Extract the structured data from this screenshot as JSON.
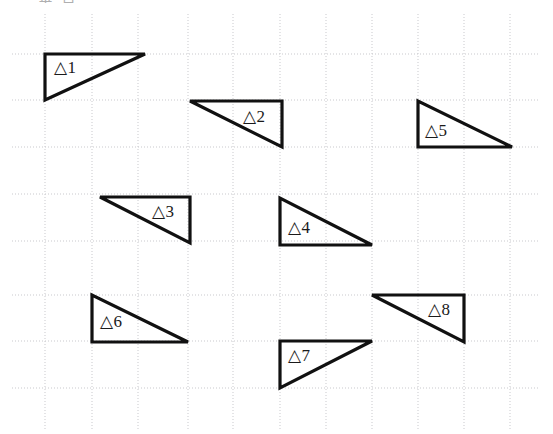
{
  "page": {
    "background_color": "#ffffff",
    "width": 553,
    "height": 434,
    "cut_off_header_text": "垂 直"
  },
  "grid": {
    "name": "dotted-grid",
    "line_color": "#c9c9cd",
    "line_style": "dotted",
    "line_width": 1,
    "dash_pattern": "1,2",
    "spacing_px": 46,
    "vertical_lines_x": [
      45,
      92,
      138,
      188,
      233,
      280,
      326,
      372,
      418,
      464,
      510
    ],
    "horizontal_lines_y": [
      54,
      100,
      147,
      194,
      241,
      295,
      341,
      388
    ]
  },
  "figures": {
    "stroke_color": "#111111",
    "stroke_width": 3.2,
    "fill": "none",
    "label_prefix": "△",
    "items": [
      {
        "id": "triangle-1",
        "label": "△1",
        "right_angle_corner": "top-left",
        "points": "45,54 145,54 45,100",
        "label_x": 54,
        "label_y": 59
      },
      {
        "id": "triangle-2",
        "label": "△2",
        "right_angle_corner": "top-right",
        "points": "190,101 282,101 282,147",
        "label_x": 243,
        "label_y": 108
      },
      {
        "id": "triangle-3",
        "label": "△3",
        "right_angle_corner": "top-right",
        "points": "100,197 190,197 190,243",
        "label_x": 152,
        "label_y": 203
      },
      {
        "id": "triangle-4",
        "label": "△4",
        "right_angle_corner": "bottom-left",
        "points": "280,198 280,245 372,245",
        "label_x": 288,
        "label_y": 219
      },
      {
        "id": "triangle-5",
        "label": "△5",
        "right_angle_corner": "bottom-left",
        "points": "418,101 418,147 512,147",
        "label_x": 425,
        "label_y": 122
      },
      {
        "id": "triangle-6",
        "label": "△6",
        "right_angle_corner": "bottom-left",
        "points": "92,295 92,342 188,342",
        "label_x": 100,
        "label_y": 313
      },
      {
        "id": "triangle-7",
        "label": "△7",
        "right_angle_corner": "top-left",
        "points": "280,341 372,341 280,388",
        "label_x": 288,
        "label_y": 347
      },
      {
        "id": "triangle-8",
        "label": "△8",
        "right_angle_corner": "top-right",
        "points": "372,295 464,295 464,342",
        "label_x": 428,
        "label_y": 301
      }
    ]
  }
}
